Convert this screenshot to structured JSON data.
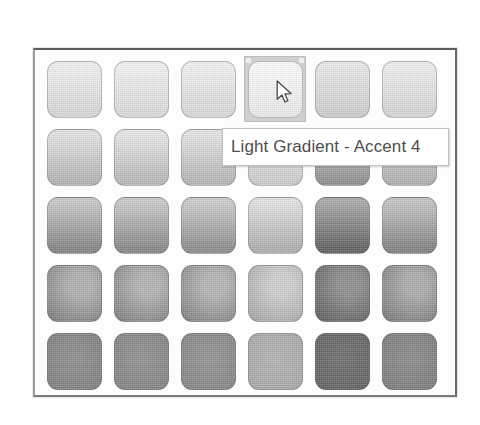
{
  "window": {
    "background_color": "#ffffff",
    "frame_border_color": "#6a6a6a",
    "frame_background": "#fdfdfd"
  },
  "gallery": {
    "name": "gradient-fill-gallery",
    "columns": 6,
    "rows": 5,
    "hovered_index": 3,
    "hover_highlight_color": "#cfcfcf",
    "swatches": [
      {
        "index": 0,
        "row": 1,
        "col": 1,
        "style": "linear-top-light",
        "top": "#f2f2f2",
        "bottom": "#d9d9d9"
      },
      {
        "index": 1,
        "row": 1,
        "col": 2,
        "style": "linear-top-light",
        "top": "#f4f4f4",
        "bottom": "#dcdcdc"
      },
      {
        "index": 2,
        "row": 1,
        "col": 3,
        "style": "linear-top-light",
        "top": "#f3f3f3",
        "bottom": "#dadada"
      },
      {
        "index": 3,
        "row": 1,
        "col": 4,
        "style": "linear-top-light",
        "top": "#fdfdfd",
        "bottom": "#ececec",
        "label": "Light Gradient - Accent 4",
        "hovered": true
      },
      {
        "index": 4,
        "row": 1,
        "col": 5,
        "style": "linear-top-light",
        "top": "#eaeaea",
        "bottom": "#cfcfcf"
      },
      {
        "index": 5,
        "row": 1,
        "col": 6,
        "style": "linear-top-light",
        "top": "#f1f1f1",
        "bottom": "#d7d7d7"
      },
      {
        "index": 6,
        "row": 2,
        "col": 1,
        "style": "linear-top-light",
        "top": "#e4e4e4",
        "bottom": "#b4b4b4"
      },
      {
        "index": 7,
        "row": 2,
        "col": 2,
        "style": "linear-top-light",
        "top": "#e8e8e8",
        "bottom": "#b9b9b9"
      },
      {
        "index": 8,
        "row": 2,
        "col": 3,
        "style": "linear-top-light",
        "top": "#e6e6e6",
        "bottom": "#b6b6b6"
      },
      {
        "index": 9,
        "row": 2,
        "col": 4,
        "style": "linear-top-light",
        "top": "#f0f0f0",
        "bottom": "#cdcdcd"
      },
      {
        "index": 10,
        "row": 2,
        "col": 5,
        "style": "linear-top-light",
        "top": "#d4d4d4",
        "bottom": "#8f8f8f"
      },
      {
        "index": 11,
        "row": 2,
        "col": 6,
        "style": "linear-top-light",
        "top": "#e2e2e2",
        "bottom": "#b0b0b0"
      },
      {
        "index": 12,
        "row": 3,
        "col": 1,
        "style": "linear-top-light",
        "top": "#c8c8c8",
        "bottom": "#838383"
      },
      {
        "index": 13,
        "row": 3,
        "col": 2,
        "style": "linear-top-light",
        "top": "#cbcbcb",
        "bottom": "#858585"
      },
      {
        "index": 14,
        "row": 3,
        "col": 3,
        "style": "linear-top-light",
        "top": "#cdcdcd",
        "bottom": "#8b8b8b"
      },
      {
        "index": 15,
        "row": 3,
        "col": 4,
        "style": "linear-top-light",
        "top": "#e3e3e3",
        "bottom": "#aeaeae"
      },
      {
        "index": 16,
        "row": 3,
        "col": 5,
        "style": "linear-top-light",
        "top": "#a7a7a7",
        "bottom": "#5e5e5e"
      },
      {
        "index": 17,
        "row": 3,
        "col": 6,
        "style": "linear-top-light",
        "top": "#c4c4c4",
        "bottom": "#808080"
      },
      {
        "index": 18,
        "row": 4,
        "col": 1,
        "style": "radial-corner",
        "light": "#b0b0b0",
        "dark": "#6e6e6e"
      },
      {
        "index": 19,
        "row": 4,
        "col": 2,
        "style": "radial-corner",
        "light": "#b2b2b2",
        "dark": "#707070"
      },
      {
        "index": 20,
        "row": 4,
        "col": 3,
        "style": "radial-corner",
        "light": "#b4b4b4",
        "dark": "#737373"
      },
      {
        "index": 21,
        "row": 4,
        "col": 4,
        "style": "radial-corner",
        "light": "#cfcfcf",
        "dark": "#9b9b9b"
      },
      {
        "index": 22,
        "row": 4,
        "col": 5,
        "style": "radial-corner",
        "light": "#8c8c8c",
        "dark": "#4f4f4f"
      },
      {
        "index": 23,
        "row": 4,
        "col": 6,
        "style": "radial-corner",
        "light": "#ababab",
        "dark": "#6b6b6b"
      },
      {
        "index": 24,
        "row": 5,
        "col": 1,
        "style": "solid-dark",
        "light": "#8e8e8e",
        "dark": "#6f6f6f"
      },
      {
        "index": 25,
        "row": 5,
        "col": 2,
        "style": "solid-dark",
        "light": "#919191",
        "dark": "#727272"
      },
      {
        "index": 26,
        "row": 5,
        "col": 3,
        "style": "solid-dark",
        "light": "#939393",
        "dark": "#767676"
      },
      {
        "index": 27,
        "row": 5,
        "col": 4,
        "style": "solid-dark",
        "light": "#b4b4b4",
        "dark": "#9a9a9a"
      },
      {
        "index": 28,
        "row": 5,
        "col": 5,
        "style": "solid-dark",
        "light": "#6d6d6d",
        "dark": "#545454"
      },
      {
        "index": 29,
        "row": 5,
        "col": 6,
        "style": "solid-dark",
        "light": "#8a8a8a",
        "dark": "#6c6c6c"
      }
    ]
  },
  "tooltip": {
    "visible": true,
    "text": "Light Gradient - Accent 4",
    "text_color": "#4e4e4e",
    "background_color": "#ffffff",
    "border_color": "#c2c2c2"
  },
  "cursor": {
    "icon": "arrow-pointer-icon",
    "x": 276,
    "y": 80
  }
}
